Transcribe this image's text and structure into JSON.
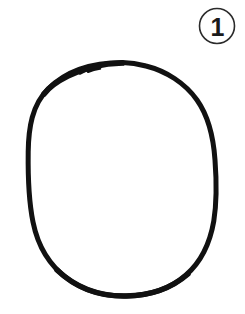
{
  "figure": {
    "background_color": "#ffffff",
    "width": 245,
    "height": 314
  },
  "badge": {
    "number": "1",
    "shape": "circle",
    "ring_color": "#2b2b2b",
    "ring_width": 1.6,
    "text_color": "#1a1a1a",
    "center_x": 217,
    "center_y": 26,
    "radius": 17.5
  },
  "shape": {
    "name": "oval-outline",
    "type": "hand-drawn-ellipse",
    "stroke_color": "#111111",
    "stroke_width": 5,
    "fill": "none",
    "bounds": {
      "left": 28,
      "top": 62,
      "right": 216,
      "bottom": 296
    },
    "center_x": 122,
    "center_y": 179,
    "radius_x": 94,
    "radius_y": 117,
    "start_artifact": {
      "name": "pen-start-hook",
      "x": 86,
      "y": 69,
      "description": "small overlapping tail where the stroke begins"
    }
  }
}
